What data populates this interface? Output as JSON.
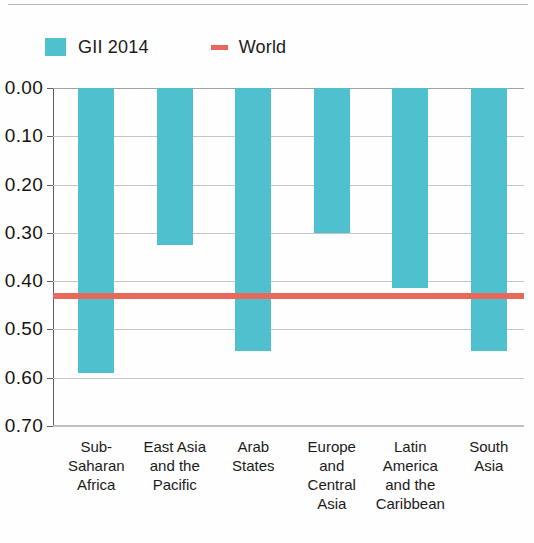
{
  "legend": {
    "items": [
      {
        "label": "GII 2014",
        "marker": "bar-swatch-icon",
        "color": "#4fc0cd"
      },
      {
        "label": "World",
        "marker": "line-swatch-icon",
        "color": "#e8685c"
      }
    ]
  },
  "chart_data": {
    "type": "bar",
    "title": "",
    "xlabel": "",
    "ylabel": "",
    "orientation": "downward",
    "grid": true,
    "legend_position": "top-left",
    "ylim": [
      0.0,
      0.7
    ],
    "y_ticks": [
      "0.00",
      "0.10",
      "0.20",
      "0.30",
      "0.40",
      "0.50",
      "0.60",
      "0.70"
    ],
    "y_tick_values": [
      0.0,
      0.1,
      0.2,
      0.3,
      0.4,
      0.5,
      0.6,
      0.7
    ],
    "categories": [
      "Sub-Saharan Africa",
      "East Asia and the Pacific",
      "Arab States",
      "Europe and Central Asia",
      "Latin America and the Caribbean",
      "South Asia"
    ],
    "category_lines": [
      [
        "Sub-Saharan",
        "Africa"
      ],
      [
        "East Asia",
        "and the",
        "Pacific"
      ],
      [
        "Arab",
        "States"
      ],
      [
        "Europe",
        "and",
        "Central",
        "Asia"
      ],
      [
        "Latin",
        "America",
        "and the",
        "Caribbean"
      ],
      [
        "South",
        "Asia"
      ]
    ],
    "series": [
      {
        "name": "GII 2014",
        "color": "#4fc0cd",
        "values": [
          0.59,
          0.325,
          0.545,
          0.3,
          0.415,
          0.545
        ]
      }
    ],
    "reference_lines": [
      {
        "name": "World",
        "value": 0.43,
        "color": "#e8685c"
      }
    ]
  }
}
